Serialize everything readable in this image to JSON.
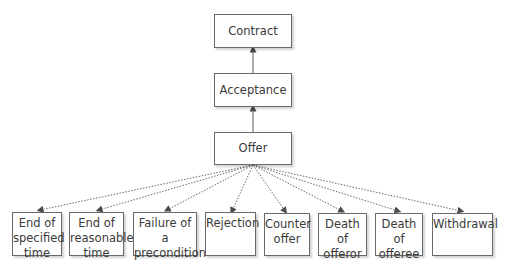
{
  "diagram": {
    "type": "hierarchy",
    "nodes": {
      "contract": {
        "label": "Contract"
      },
      "acceptance": {
        "label": "Acceptance"
      },
      "offer": {
        "label": "Offer"
      }
    },
    "terminations": [
      {
        "id": "end-specified",
        "line1": "End of",
        "line2": "specified",
        "line3": "time"
      },
      {
        "id": "end-reasonable",
        "line1": "End of",
        "line2": "reasonable",
        "line3": "time"
      },
      {
        "id": "failure-precondition",
        "line1": "Failure of a",
        "line2": "precondition",
        "line3": ""
      },
      {
        "id": "rejection",
        "line1": "Rejection",
        "line2": "",
        "line3": ""
      },
      {
        "id": "counter-offer",
        "line1": "Counter",
        "line2": "offer",
        "line3": ""
      },
      {
        "id": "death-offeror",
        "line1": "Death of",
        "line2": "offeror",
        "line3": ""
      },
      {
        "id": "death-offeree",
        "line1": "Death of",
        "line2": "offeree",
        "line3": ""
      },
      {
        "id": "withdrawal",
        "line1": "Withdrawal",
        "line2": "",
        "line3": ""
      }
    ],
    "edges": [
      {
        "from": "offer",
        "to": "acceptance",
        "style": "solid"
      },
      {
        "from": "acceptance",
        "to": "contract",
        "style": "solid"
      },
      {
        "from": "offer",
        "to": "end-specified",
        "style": "dotted"
      },
      {
        "from": "offer",
        "to": "end-reasonable",
        "style": "dotted"
      },
      {
        "from": "offer",
        "to": "failure-precondition",
        "style": "dotted"
      },
      {
        "from": "offer",
        "to": "rejection",
        "style": "dotted"
      },
      {
        "from": "offer",
        "to": "counter-offer",
        "style": "dotted"
      },
      {
        "from": "offer",
        "to": "death-offeror",
        "style": "dotted"
      },
      {
        "from": "offer",
        "to": "death-offeree",
        "style": "dotted"
      },
      {
        "from": "offer",
        "to": "withdrawal",
        "style": "dotted"
      }
    ]
  }
}
